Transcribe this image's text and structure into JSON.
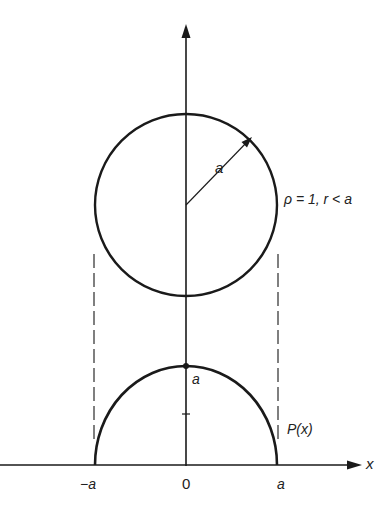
{
  "figure": {
    "colors": {
      "stroke": "#1a1a1a",
      "dashed": "#555555",
      "background": "#ffffff"
    },
    "labels": {
      "radius": "a",
      "density": "ρ = 1, r < a",
      "peak": "a",
      "projection": "P(x)",
      "x_axis": "x",
      "tick_neg_a": "−a",
      "tick_zero": "0",
      "tick_pos_a": "a"
    },
    "circle": {
      "cx": 186,
      "cy": 205,
      "r": 91
    },
    "profile": {
      "cx": 186,
      "baseline_y": 465,
      "rx": 91,
      "ry": 99
    },
    "axes": {
      "vertical": {
        "x": 186,
        "y_top": 25,
        "y_bottom": 465
      },
      "horizontal": {
        "y": 465,
        "x_left": 0,
        "x_right": 360
      }
    }
  }
}
